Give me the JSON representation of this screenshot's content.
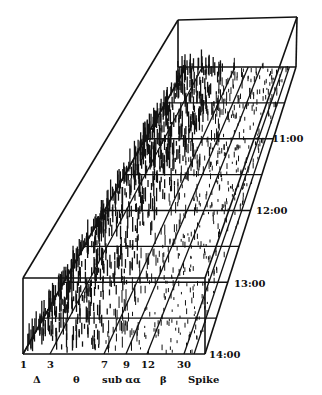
{
  "chart_data": {
    "type": "heatmap",
    "title": "",
    "xlabel": "Frequency (Hz)",
    "ylabel": "Time",
    "x_ticks": [
      "1",
      "3",
      "7",
      "9",
      "12",
      "30"
    ],
    "bands": [
      "Δ",
      "θ",
      "sub α",
      "α",
      "β",
      "Spike"
    ],
    "time_labels": [
      "11:00",
      "12:00",
      "13:00",
      "14:00"
    ],
    "grid": true,
    "colors": {
      "ink": "#111111",
      "background": "#ffffff"
    }
  },
  "geometry": {
    "front": {
      "x0": 23,
      "x1": 205,
      "y": 354,
      "top": 278
    },
    "back": {
      "x0": 186,
      "x1": 296,
      "y": 67,
      "top": 18
    },
    "tick_x": [
      23,
      50,
      104,
      126,
      147,
      184
    ],
    "grid_fracs": [
      0.125,
      0.25,
      0.375,
      0.5,
      0.625,
      0.75,
      0.875
    ]
  }
}
